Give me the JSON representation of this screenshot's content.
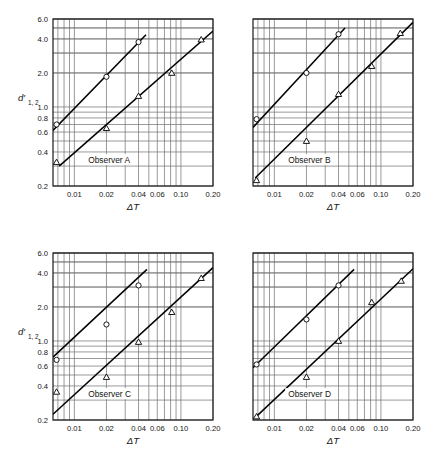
{
  "figure": {
    "type": "multi-panel-log-log-scatter",
    "panel_count": 4,
    "background_color": "#ffffff",
    "line_color": "#000000",
    "grid_color": "#6e6e6e",
    "frame_color": "#1a1a1a"
  },
  "axes": {
    "x": {
      "title": "ΔT",
      "scale": "log",
      "min": 0.0063,
      "max": 0.2,
      "tick_labels": [
        "0.01",
        "0.02",
        "0.04",
        "0.06",
        "0.10",
        "0.20"
      ],
      "tick_values": [
        0.01,
        0.02,
        0.04,
        0.06,
        0.1,
        0.2
      ],
      "minor_ticks": [
        0.007,
        0.008,
        0.009,
        0.01,
        0.02,
        0.03,
        0.04,
        0.05,
        0.06,
        0.07,
        0.08,
        0.09,
        0.1,
        0.12,
        0.14,
        0.16,
        0.18,
        0.2
      ]
    },
    "y": {
      "title_main": "d′",
      "title_sub": "1, 2",
      "scale": "log",
      "min": 0.2,
      "max": 6.0,
      "tick_labels": [
        "6.0",
        "4.0",
        "2.0",
        "1.0",
        "0.8",
        "0.6",
        "0.4",
        "0.2"
      ],
      "tick_values": [
        6.0,
        4.0,
        2.0,
        1.0,
        0.8,
        0.6,
        0.4,
        0.2
      ],
      "minor_ticks": [
        0.2,
        0.3,
        0.4,
        0.5,
        0.6,
        0.7,
        0.8,
        0.9,
        1.0,
        2.0,
        3.0,
        4.0,
        5.0,
        6.0
      ]
    },
    "legend_position": "none"
  },
  "chart_data": {
    "type": "scatter",
    "title": "",
    "xlabel": "ΔT",
    "ylabel": "d'_1,2",
    "xscale": "log",
    "yscale": "log",
    "xlim": [
      0.0063,
      0.2
    ],
    "ylim": [
      0.2,
      6.0
    ],
    "grid": true,
    "panels": [
      {
        "label": "Observer A",
        "position": "top-left",
        "series": [
          {
            "name": "circles",
            "marker": "circle",
            "x": [
              0.0068,
              0.02,
              0.04
            ],
            "y": [
              0.7,
              1.85,
              3.75
            ],
            "fit_line": {
              "x": [
                0.0063,
                0.047
              ],
              "y": [
                0.62,
                4.35
              ]
            }
          },
          {
            "name": "triangles",
            "marker": "triangle",
            "x": [
              0.0068,
              0.02,
              0.04,
              0.082,
              0.155
            ],
            "y": [
              0.325,
              0.65,
              1.25,
              2.0,
              3.95
            ],
            "fit_line": {
              "x": [
                0.0072,
                0.2
              ],
              "y": [
                0.3,
                4.7
              ]
            }
          }
        ]
      },
      {
        "label": "Observer B",
        "position": "top-right",
        "series": [
          {
            "name": "circles",
            "marker": "circle",
            "x": [
              0.0068,
              0.02,
              0.04
            ],
            "y": [
              0.78,
              2.0,
              4.4
            ],
            "fit_line": {
              "x": [
                0.0063,
                0.046
              ],
              "y": [
                0.66,
                5.0
              ]
            }
          },
          {
            "name": "triangles",
            "marker": "triangle",
            "x": [
              0.0068,
              0.02,
              0.04,
              0.082,
              0.152
            ],
            "y": [
              0.225,
              0.5,
              1.3,
              2.3,
              4.5
            ],
            "fit_line": {
              "x": [
                0.0066,
                0.2
              ],
              "y": [
                0.235,
                5.6
              ]
            }
          }
        ]
      },
      {
        "label": "Observer C",
        "position": "bottom-left",
        "series": [
          {
            "name": "circles",
            "marker": "circle",
            "x": [
              0.0068,
              0.02,
              0.04
            ],
            "y": [
              0.68,
              1.4,
              3.1
            ],
            "fit_line": {
              "x": [
                0.0063,
                0.048
              ],
              "y": [
                0.72,
                4.3
              ]
            }
          },
          {
            "name": "triangles",
            "marker": "triangle",
            "x": [
              0.0068,
              0.02,
              0.04,
              0.082,
              0.155
            ],
            "y": [
              0.355,
              0.48,
              0.98,
              1.8,
              3.6
            ],
            "fit_line": {
              "x": [
                0.0063,
                0.2
              ],
              "y": [
                0.225,
                4.45
              ]
            }
          }
        ]
      },
      {
        "label": "Observer D",
        "position": "bottom-right",
        "series": [
          {
            "name": "circles",
            "marker": "circle",
            "x": [
              0.0068,
              0.02,
              0.04
            ],
            "y": [
              0.62,
              1.55,
              3.1
            ],
            "fit_line": {
              "x": [
                0.0063,
                0.056
              ],
              "y": [
                0.58,
                4.3
              ]
            }
          },
          {
            "name": "triangles",
            "marker": "triangle",
            "x": [
              0.0068,
              0.02,
              0.04,
              0.082,
              0.155
            ],
            "y": [
              0.215,
              0.48,
              1.0,
              2.2,
              3.4
            ],
            "fit_line": {
              "x": [
                0.0066,
                0.2
              ],
              "y": [
                0.21,
                4.35
              ]
            }
          }
        ]
      }
    ]
  }
}
